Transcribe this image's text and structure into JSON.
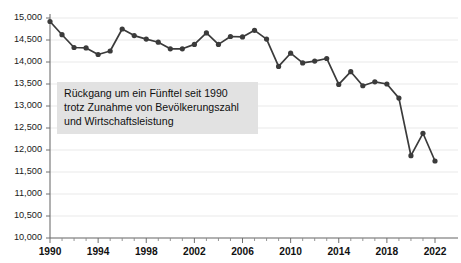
{
  "chart_data": {
    "type": "line",
    "title": "",
    "subtitle": "",
    "xlabel": "",
    "ylabel": "",
    "x": [
      1990,
      1991,
      1992,
      1993,
      1994,
      1995,
      1996,
      1997,
      1998,
      1999,
      2000,
      2001,
      2002,
      2003,
      2004,
      2005,
      2006,
      2007,
      2008,
      2009,
      2010,
      2011,
      2012,
      2013,
      2014,
      2015,
      2016,
      2017,
      2018,
      2019,
      2020,
      2021,
      2022
    ],
    "values": [
      14920,
      14620,
      14330,
      14320,
      14170,
      14250,
      14750,
      14600,
      14520,
      14450,
      14300,
      14300,
      14400,
      14660,
      14400,
      14580,
      14570,
      14720,
      14520,
      13900,
      14200,
      13980,
      14020,
      14080,
      13490,
      13780,
      13460,
      13550,
      13500,
      13180,
      11870,
      12380,
      11750
    ],
    "series": [
      {
        "name": "Primärenergieverbrauch",
        "values": [
          14920,
          14620,
          14330,
          14320,
          14170,
          14250,
          14750,
          14600,
          14520,
          14450,
          14300,
          14300,
          14400,
          14660,
          14400,
          14580,
          14570,
          14720,
          14520,
          13900,
          14200,
          13980,
          14020,
          14080,
          13490,
          13780,
          13460,
          13550,
          13500,
          13180,
          11870,
          12380,
          11750
        ]
      }
    ],
    "ylim": [
      10000,
      15000
    ],
    "ytick_values": [
      10000,
      10500,
      11000,
      11500,
      12000,
      12500,
      13000,
      13500,
      14000,
      14500,
      15000
    ],
    "ytick_labels": [
      "10,000",
      "10,500",
      "11,000",
      "11,500",
      "12,000",
      "12,500",
      "13,000",
      "13,500",
      "14,000",
      "14,500",
      "15,000"
    ],
    "xlim": [
      1990,
      2022
    ],
    "xtick_values": [
      1990,
      1994,
      1998,
      2002,
      2006,
      2010,
      2014,
      2018,
      2022
    ],
    "xtick_labels": [
      "1990",
      "1994",
      "1998",
      "2002",
      "2006",
      "2010",
      "2014",
      "2018",
      "2022"
    ],
    "grid": true,
    "grid_axis": "y",
    "legend": false,
    "legend_position": "none",
    "line_color": "#3b3b3b",
    "marker_color": "#3b3b3b",
    "grid_color": "#e9e9e9",
    "axis_color": "#6f6f6f",
    "background_color": "#ffffff"
  },
  "annotation": {
    "background_color": "#e2e2e2",
    "text_color": "#101010",
    "lines": [
      "Rückgang um ein Fünftel seit 1990",
      "trotz Zunahme von Bevölkerungszahl",
      "und Wirtschaftsleistung"
    ]
  }
}
